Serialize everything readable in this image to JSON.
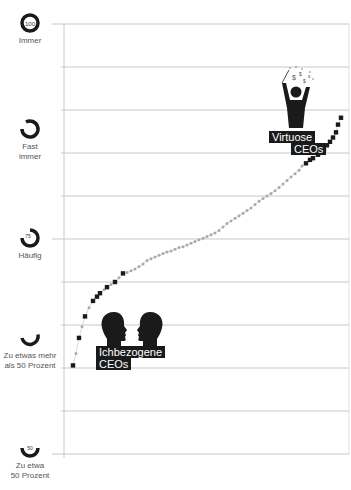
{
  "chart_data": {
    "type": "scatter",
    "title": "",
    "xlabel": "",
    "ylabel": "",
    "ylim": [
      50,
      100
    ],
    "y_ticks": [
      {
        "value": 100,
        "label": "Immer",
        "gauge_number": "100"
      },
      {
        "value": 90,
        "label": "Fast immer",
        "gauge_number": ""
      },
      {
        "value": 75,
        "label": "Häufig",
        "gauge_number": "75"
      },
      {
        "value": 60,
        "label": "Zu etwas mehr als 50 Prozent",
        "gauge_number": ""
      },
      {
        "value": 50,
        "label": "Zu etwa 50 Prozent",
        "gauge_number": "50"
      }
    ],
    "grid": true,
    "grid_step": 5,
    "series": [
      {
        "name": "Ichbezogene CEOs",
        "color": "#1a1a1a",
        "marker": "square"
      },
      {
        "name": "Mittlere CEOs",
        "color": "#aaaaaa",
        "marker": "dot"
      },
      {
        "name": "Virtuose CEOs",
        "color": "#1a1a1a",
        "marker": "square"
      }
    ],
    "points": [
      [
        73,
        60.3,
        "b"
      ],
      [
        76,
        61.7,
        "g"
      ],
      [
        79,
        63.5,
        "b"
      ],
      [
        82,
        64.8,
        "g"
      ],
      [
        85,
        66.0,
        "b"
      ],
      [
        89,
        67.0,
        "g"
      ],
      [
        93,
        67.8,
        "b"
      ],
      [
        97,
        68.3,
        "b"
      ],
      [
        100,
        68.7,
        "b"
      ],
      [
        104,
        69.1,
        "g"
      ],
      [
        107,
        69.4,
        "b"
      ],
      [
        111,
        69.7,
        "g"
      ],
      [
        115,
        70.0,
        "b"
      ],
      [
        119,
        70.5,
        "g"
      ],
      [
        123,
        71.0,
        "b"
      ],
      [
        127,
        71.1,
        "g"
      ],
      [
        131,
        71.3,
        "g"
      ],
      [
        135,
        71.5,
        "g"
      ],
      [
        139,
        71.8,
        "g"
      ],
      [
        143,
        72.1,
        "g"
      ],
      [
        147,
        72.5,
        "g"
      ],
      [
        151,
        72.7,
        "g"
      ],
      [
        155,
        72.9,
        "g"
      ],
      [
        159,
        73.1,
        "g"
      ],
      [
        163,
        73.3,
        "g"
      ],
      [
        167,
        73.5,
        "g"
      ],
      [
        171,
        73.6,
        "g"
      ],
      [
        175,
        73.8,
        "g"
      ],
      [
        179,
        74.0,
        "g"
      ],
      [
        183,
        74.1,
        "g"
      ],
      [
        187,
        74.3,
        "g"
      ],
      [
        191,
        74.5,
        "g"
      ],
      [
        195,
        74.7,
        "g"
      ],
      [
        199,
        74.9,
        "g"
      ],
      [
        203,
        75.1,
        "g"
      ],
      [
        207,
        75.3,
        "g"
      ],
      [
        211,
        75.5,
        "g"
      ],
      [
        215,
        75.7,
        "g"
      ],
      [
        219,
        76.0,
        "g"
      ],
      [
        223,
        76.4,
        "g"
      ],
      [
        227,
        76.8,
        "g"
      ],
      [
        231,
        77.1,
        "g"
      ],
      [
        235,
        77.4,
        "g"
      ],
      [
        239,
        77.7,
        "g"
      ],
      [
        243,
        78.0,
        "g"
      ],
      [
        247,
        78.3,
        "g"
      ],
      [
        251,
        78.6,
        "g"
      ],
      [
        255,
        79.0,
        "g"
      ],
      [
        259,
        79.4,
        "g"
      ],
      [
        263,
        79.7,
        "g"
      ],
      [
        267,
        80.0,
        "g"
      ],
      [
        271,
        80.3,
        "g"
      ],
      [
        275,
        80.6,
        "g"
      ],
      [
        279,
        81.0,
        "g"
      ],
      [
        283,
        81.4,
        "g"
      ],
      [
        287,
        81.8,
        "g"
      ],
      [
        291,
        82.2,
        "g"
      ],
      [
        295,
        82.6,
        "g"
      ],
      [
        299,
        83.0,
        "g"
      ],
      [
        302,
        83.5,
        "g"
      ],
      [
        306,
        83.8,
        "b"
      ],
      [
        310,
        84.2,
        "b"
      ],
      [
        313,
        84.4,
        "b"
      ],
      [
        318,
        84.8,
        "b"
      ],
      [
        321,
        85.1,
        "b"
      ],
      [
        324,
        85.4,
        "b"
      ],
      [
        327,
        85.9,
        "b"
      ],
      [
        330,
        86.3,
        "b"
      ],
      [
        333,
        86.8,
        "b"
      ],
      [
        336,
        87.4,
        "b"
      ],
      [
        338,
        88.3,
        "b"
      ],
      [
        341,
        89.1,
        "b"
      ]
    ],
    "annotations": [
      {
        "text_lines": [
          "Ichbezogene",
          "CEOs"
        ],
        "icon": "two-heads-facing-icon"
      },
      {
        "text_lines": [
          "Virtuose",
          "CEOs"
        ],
        "icon": "juggling-money-person-icon"
      }
    ]
  },
  "labels": {
    "g100_num": "100",
    "g100_text": "Immer",
    "g90_text1": "Fast",
    "g90_text2": "immer",
    "g75_num": "75",
    "g75_text": "Häufig",
    "g60_text1": "Zu etwas mehr",
    "g60_text2": "als 50 Prozent",
    "g50_num": "50",
    "g50_text1": "Zu etwa",
    "g50_text2": "50 Prozent",
    "ich1": "Ichbezogene",
    "ich2": "CEOs",
    "vir1": "Virtuose",
    "vir2": "CEOs",
    "money_symbol": "$"
  },
  "colors": {
    "dark": "#1a1a1a",
    "grid": "#c8c8c8",
    "mid_points": "#aaaaaa"
  }
}
